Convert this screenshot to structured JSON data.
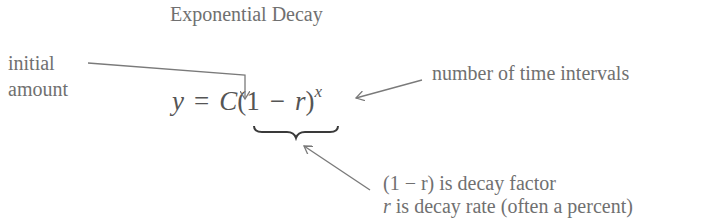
{
  "title": "Exponential Decay",
  "formula": {
    "y": "y",
    "equals": "=",
    "C": "C",
    "open_paren": "(",
    "one": "1",
    "minus": "−",
    "r": "r",
    "close_paren": ")",
    "exponent": "x"
  },
  "annotations": {
    "initial_amount": [
      "initial",
      "amount"
    ],
    "time_intervals": "number of time intervals",
    "decay_factor": {
      "expr": "(1 − r)",
      "text": " is decay factor"
    },
    "decay_rate": {
      "var": "r",
      "text": " is decay rate (often a percent)"
    }
  },
  "colors": {
    "text": "#707070",
    "formula": "#555555",
    "arrow": "#7a7a7a"
  }
}
